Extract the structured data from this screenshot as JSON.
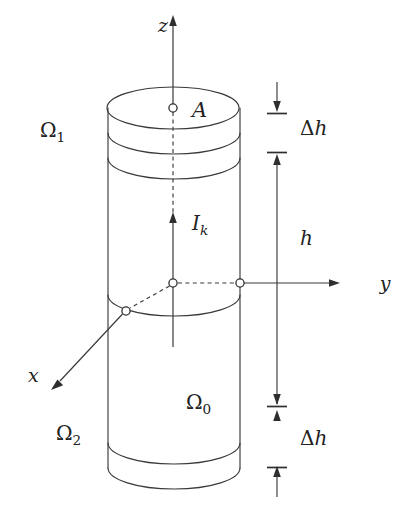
{
  "figure": {
    "background_color": "#ffffff",
    "line_color": "#3a3a3a",
    "width": 411,
    "height": 513
  },
  "axes": {
    "z": {
      "label": "z",
      "direction": "up",
      "tip_x": 173,
      "tip_y": 18
    },
    "y": {
      "label": "y",
      "direction": "right",
      "tip_x": 372,
      "tip_y": 283
    },
    "x": {
      "label": "x",
      "direction": "down-left",
      "tip_x": 47,
      "tip_y": 388
    }
  },
  "labels": {
    "point_a": "A",
    "current": {
      "base": "I",
      "sub": "k"
    },
    "omega_1": {
      "base": "Ω",
      "sub": "1"
    },
    "omega_2": {
      "base": "Ω",
      "sub": "2"
    },
    "omega_0": {
      "base": "Ω",
      "sub": "0"
    }
  },
  "dimensions": [
    {
      "name": "delta-h-top",
      "base": "Δ",
      "italic": "h",
      "label_x": 300,
      "label_y": 128
    },
    {
      "name": "h-total",
      "base": "",
      "italic": "h",
      "label_x": 300,
      "label_y": 238
    },
    {
      "name": "delta-h-bottom",
      "base": "Δ",
      "italic": "h",
      "label_x": 300,
      "label_y": 438
    }
  ],
  "markers": [
    {
      "name": "point-a-marker",
      "x": 173,
      "y": 108,
      "r": 4.1
    },
    {
      "name": "origin-marker",
      "x": 173,
      "y": 283,
      "r": 4.1
    },
    {
      "name": "y-axis-surface-marker",
      "x": 240,
      "y": 283,
      "r": 4.1
    },
    {
      "name": "x-axis-surface-marker",
      "x": 126,
      "y": 311,
      "r": 4.1
    }
  ],
  "geometry": {
    "cylinder_left_x": 108,
    "cylinder_right_x": 240,
    "ellipse_rx": 66,
    "ellipse_ry": 21,
    "ellipse_centers_y": [
      108,
      133,
      158,
      295,
      443,
      468
    ],
    "dimension_line_x": 277
  }
}
